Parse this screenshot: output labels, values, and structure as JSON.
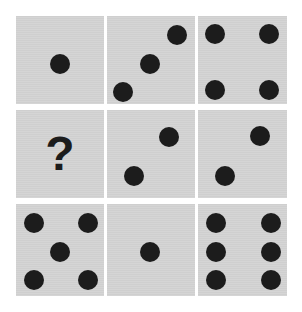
{
  "puzzle": {
    "title": "Dice pattern matrix",
    "colors": {
      "background": "#ffffff",
      "cell_fill": "#d3d3d3",
      "pip": "#1c1c1c"
    },
    "cells": [
      {
        "row": 0,
        "col": 0,
        "x": 16,
        "y": 16,
        "w": 88,
        "h": 88,
        "pip_count": 1,
        "pips": [
          [
            44,
            48
          ]
        ]
      },
      {
        "row": 0,
        "col": 1,
        "x": 107,
        "y": 16,
        "w": 88,
        "h": 88,
        "pip_count": 3,
        "pips": [
          [
            70,
            19
          ],
          [
            43,
            48
          ],
          [
            16,
            76
          ]
        ]
      },
      {
        "row": 0,
        "col": 2,
        "x": 198,
        "y": 16,
        "w": 89,
        "h": 88,
        "pip_count": 4,
        "pips": [
          [
            17,
            18
          ],
          [
            71,
            18
          ],
          [
            17,
            74
          ],
          [
            71,
            74
          ]
        ]
      },
      {
        "row": 1,
        "col": 0,
        "x": 16,
        "y": 110,
        "w": 88,
        "h": 88,
        "pip_count": null,
        "label": "?"
      },
      {
        "row": 1,
        "col": 1,
        "x": 107,
        "y": 110,
        "w": 88,
        "h": 88,
        "pip_count": 2,
        "pips": [
          [
            62,
            27
          ],
          [
            27,
            66
          ]
        ]
      },
      {
        "row": 1,
        "col": 2,
        "x": 198,
        "y": 110,
        "w": 89,
        "h": 88,
        "pip_count": 2,
        "pips": [
          [
            62,
            26
          ],
          [
            27,
            66
          ]
        ]
      },
      {
        "row": 2,
        "col": 0,
        "x": 16,
        "y": 204,
        "w": 88,
        "h": 92,
        "pip_count": 5,
        "pips": [
          [
            18,
            19
          ],
          [
            72,
            19
          ],
          [
            44,
            48
          ],
          [
            18,
            76
          ],
          [
            72,
            76
          ]
        ]
      },
      {
        "row": 2,
        "col": 1,
        "x": 107,
        "y": 204,
        "w": 88,
        "h": 92,
        "pip_count": 1,
        "pips": [
          [
            43,
            48
          ]
        ]
      },
      {
        "row": 2,
        "col": 2,
        "x": 198,
        "y": 204,
        "w": 89,
        "h": 92,
        "pip_count": 6,
        "pips": [
          [
            18,
            19
          ],
          [
            73,
            19
          ],
          [
            18,
            48
          ],
          [
            73,
            48
          ],
          [
            18,
            76
          ],
          [
            73,
            76
          ]
        ]
      }
    ],
    "missing_label": "?"
  }
}
